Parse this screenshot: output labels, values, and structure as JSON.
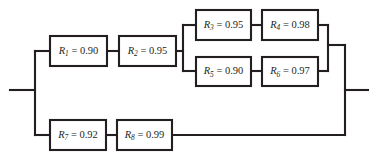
{
  "diagram": {
    "kind": "reliability-block-diagram",
    "title": "",
    "background_color": "#ffffff",
    "line_color": "#231f20",
    "block_fill": "#ffffff",
    "equals_sign": "=",
    "input_terminal_label": "",
    "output_terminal_label": "",
    "blocks": [
      {
        "id": "R1",
        "symbol": "R",
        "subscript": "1",
        "value": "0.90",
        "text": "R1 = 0.90",
        "x": 50,
        "y": 36,
        "w": 57,
        "h": 30
      },
      {
        "id": "R2",
        "symbol": "R",
        "subscript": "2",
        "value": "0.95",
        "text": "R2 = 0.95",
        "x": 119,
        "y": 36,
        "w": 57,
        "h": 30
      },
      {
        "id": "R3",
        "symbol": "R",
        "subscript": "3",
        "value": "0.95",
        "text": "R3 = 0.95",
        "x": 196,
        "y": 10,
        "w": 55,
        "h": 30
      },
      {
        "id": "R4",
        "symbol": "R",
        "subscript": "4",
        "value": "0.98",
        "text": "R4 = 0.98",
        "x": 262,
        "y": 10,
        "w": 56,
        "h": 30
      },
      {
        "id": "R5",
        "symbol": "R",
        "subscript": "5",
        "value": "0.90",
        "text": "R5 = 0.90",
        "x": 196,
        "y": 57,
        "w": 55,
        "h": 29
      },
      {
        "id": "R6",
        "symbol": "R",
        "subscript": "6",
        "value": "0.97",
        "text": "R6 = 0.97",
        "x": 262,
        "y": 57,
        "w": 56,
        "h": 29
      },
      {
        "id": "R7",
        "symbol": "R",
        "subscript": "7",
        "value": "0.92",
        "text": "R7 = 0.92",
        "x": 50,
        "y": 120,
        "w": 56,
        "h": 30
      },
      {
        "id": "R8",
        "symbol": "R",
        "subscript": "8",
        "value": "0.99",
        "text": "R8 = 0.99",
        "x": 117,
        "y": 120,
        "w": 55,
        "h": 30
      }
    ],
    "wires": [
      {
        "name": "input-stub",
        "d": "M 10 90 L 35 90"
      },
      {
        "name": "left-bus",
        "d": "M 35 51 L 35 135"
      },
      {
        "name": "left-bus-to-r1",
        "d": "M 35 51 L 50 51"
      },
      {
        "name": "left-bus-to-r7",
        "d": "M 35 135 L 50 135"
      },
      {
        "name": "r1-to-r2",
        "d": "M 107 51 L 119 51"
      },
      {
        "name": "r2-to-split",
        "d": "M 176 51 L 183 51"
      },
      {
        "name": "split-bus",
        "d": "M 183 25 L 183 71"
      },
      {
        "name": "split-to-r3",
        "d": "M 183 25 L 196 25"
      },
      {
        "name": "split-to-r5",
        "d": "M 183 71 L 196 71"
      },
      {
        "name": "r3-to-r4",
        "d": "M 251 25 L 262 25"
      },
      {
        "name": "r5-to-r6",
        "d": "M 251 71 L 262 71"
      },
      {
        "name": "r4-to-merge",
        "d": "M 318 25 L 328 25"
      },
      {
        "name": "r6-to-merge",
        "d": "M 318 71 L 328 71"
      },
      {
        "name": "merge-bus",
        "d": "M 328 25 L 328 71"
      },
      {
        "name": "merge-to-right-bus",
        "d": "M 328 45 L 345 45"
      },
      {
        "name": "right-bus",
        "d": "M 345 45 L 345 135"
      },
      {
        "name": "output-stub",
        "d": "M 345 90 L 368 90"
      },
      {
        "name": "r7-to-r8",
        "d": "M 106 135 L 117 135"
      },
      {
        "name": "r8-to-right-bus",
        "d": "M 172 135 L 345 135"
      }
    ]
  }
}
